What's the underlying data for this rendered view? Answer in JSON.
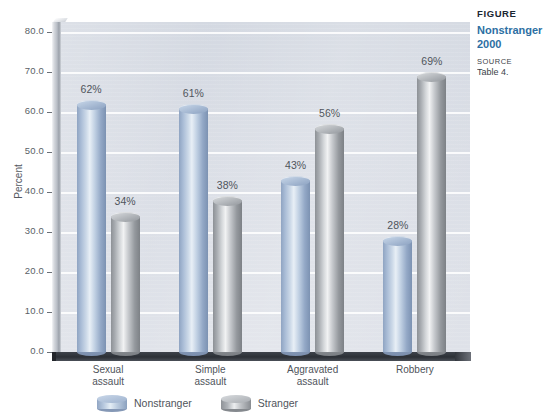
{
  "chart_data": {
    "type": "bar",
    "title": "Nonstranger",
    "subtitle": "2000",
    "xlabel": "",
    "ylabel": "Percent",
    "ylim": [
      0,
      80
    ],
    "ytick_step": 10,
    "yticks": [
      "80.0",
      "70.0",
      "60.0",
      "50.0",
      "40.0",
      "30.0",
      "20.0",
      "10.0",
      "0.0"
    ],
    "grid": true,
    "legend_position": "bottom",
    "value_suffix": "%",
    "categories": [
      "Sexual assault",
      "Simple assault",
      "Aggravated assault",
      "Robbery"
    ],
    "category_lines": [
      [
        "Sexual",
        "assault"
      ],
      [
        "Simple",
        "assault"
      ],
      [
        "Aggravated",
        "assault"
      ],
      [
        "Robbery"
      ]
    ],
    "series": [
      {
        "name": "Nonstranger",
        "color": "#a9bcd6",
        "values": [
          62,
          61,
          43,
          28
        ],
        "labels": [
          "62%",
          "61%",
          "43%",
          "28%"
        ]
      },
      {
        "name": "Stranger",
        "color": "#a7abb0",
        "values": [
          34,
          38,
          56,
          69
        ],
        "labels": [
          "34%",
          "38%",
          "56%",
          "69%"
        ]
      }
    ]
  },
  "caption": {
    "figure_label": "FIGURE",
    "title": "Nonstranger",
    "year": "2000",
    "source_label": "SOURCE",
    "source_text": "Table 4."
  },
  "legend": {
    "items": [
      {
        "label": "Nonstranger",
        "swatch": "blue"
      },
      {
        "label": "Stranger",
        "swatch": "gray"
      }
    ]
  },
  "colors": {
    "plot_background": "#d9dde5",
    "gridline": "#ffffff",
    "floor": "#2c3036",
    "series_nonstranger": "#a9bcd6",
    "series_stranger": "#a7abb0",
    "caption_accent": "#2d6fa3",
    "text": "#4f545b"
  }
}
